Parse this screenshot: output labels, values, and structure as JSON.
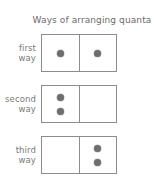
{
  "figure": {
    "title": "Ways of arranging quanta",
    "colors": {
      "box_border": "#8c8c8c",
      "quantum_fill": "#6e6e6e",
      "label_text": "#7a7a7a",
      "title_text": "#6b6b6b",
      "background": "#ffffff"
    },
    "rows": [
      {
        "label_line1": "first",
        "label_line2": "way",
        "left_cell_quanta": 1,
        "right_cell_quanta": 1
      },
      {
        "label_line1": "second",
        "label_line2": "way",
        "left_cell_quanta": 2,
        "right_cell_quanta": 0
      },
      {
        "label_line1": "third",
        "label_line2": "way",
        "left_cell_quanta": 0,
        "right_cell_quanta": 2
      }
    ]
  }
}
